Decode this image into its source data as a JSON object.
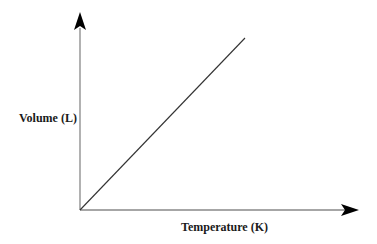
{
  "chart_data": {
    "type": "line",
    "title": "",
    "xlabel": "Temperature (K)",
    "ylabel": "Volume (L)",
    "x_ticks": [],
    "y_ticks": [],
    "grid": false,
    "legend": null,
    "series": [
      {
        "name": "Volume vs Temperature",
        "x": [
          0,
          1
        ],
        "y": [
          0,
          1
        ],
        "description": "Straight line from origin, directly proportional (Charles's Law)"
      }
    ],
    "xlim": [
      0,
      1.69
    ],
    "ylim": [
      0,
      1.14
    ],
    "colors": {
      "axis": "#000000",
      "line": "#333333",
      "label": "#1a1a1a"
    }
  }
}
